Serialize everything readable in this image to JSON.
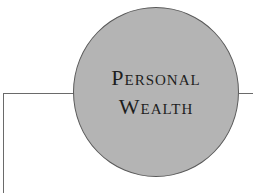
{
  "diagram": {
    "node": {
      "line1": "Personal",
      "line2": "Wealth",
      "fill": "#b4b4b4",
      "stroke": "#5a5a5a"
    },
    "connector_color": "#6a6a6a"
  }
}
